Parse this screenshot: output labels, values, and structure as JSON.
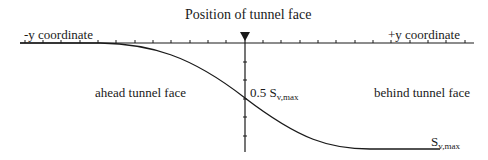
{
  "diagram": {
    "title": "Position of tunnel face",
    "axis": {
      "negative_label": "-y coordinate",
      "positive_label": "+y coordinate"
    },
    "regions": {
      "ahead": "ahead tunnel face",
      "behind": "behind tunnel face"
    },
    "annotations": {
      "half_settlement_prefix": "0.5 S",
      "half_settlement_sub": "v,max",
      "max_settlement_prefix": "S",
      "max_settlement_sub": "v,max"
    },
    "marker": "arrow-down",
    "colors": {
      "line": "#1a1a1a",
      "background": "#ffffff"
    }
  }
}
